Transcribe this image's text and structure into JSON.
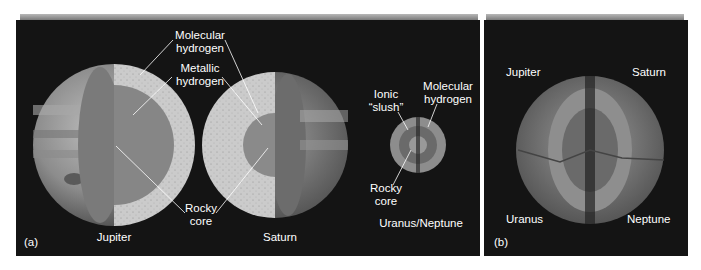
{
  "figure": {
    "panel_a": {
      "tag": "(a)",
      "planets": [
        {
          "name": "Jupiter"
        },
        {
          "name": "Saturn"
        },
        {
          "name": "Uranus/Neptune"
        }
      ],
      "callouts": {
        "molecular_hydrogen": [
          "Molecular",
          "hydrogen"
        ],
        "metallic_hydrogen": [
          "Metallic",
          "hydrogen"
        ],
        "rocky_core": [
          "Rocky",
          "core"
        ],
        "ionic_slush": [
          "Ionic",
          "“slush”"
        ],
        "un_molecular_hydrogen": [
          "Molecular",
          "hydrogen"
        ],
        "un_rocky_core": [
          "Rocky",
          "core"
        ]
      }
    },
    "panel_b": {
      "tag": "(b)",
      "quadrant_labels": {
        "top_left": "Jupiter",
        "top_right": "Saturn",
        "bottom_left": "Uranus",
        "bottom_right": "Neptune"
      }
    },
    "colors": {
      "background": "#141414",
      "molecular_layer": "#c9c9c9",
      "metallic_layer": "#8a8a8a",
      "core": "#6e6e6e",
      "label_text": "#ffffff"
    }
  }
}
